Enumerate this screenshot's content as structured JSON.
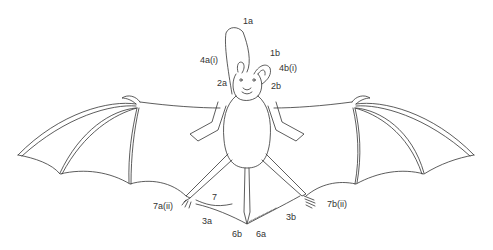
{
  "diagram": {
    "stroke_color": "#333333",
    "background": "#ffffff",
    "labels": [
      {
        "id": "1a",
        "text": "1a",
        "x": 243,
        "y": 17
      },
      {
        "id": "4a_i",
        "text": "4a(i)",
        "x": 200,
        "y": 56
      },
      {
        "id": "1b",
        "text": "1b",
        "x": 270,
        "y": 49
      },
      {
        "id": "4b_i",
        "text": "4b(i)",
        "x": 279,
        "y": 64
      },
      {
        "id": "2a",
        "text": "2a",
        "x": 217,
        "y": 79
      },
      {
        "id": "2b",
        "text": "2b",
        "x": 271,
        "y": 82
      },
      {
        "id": "7",
        "text": "7",
        "x": 212,
        "y": 193
      },
      {
        "id": "7a_ii",
        "text": "7a(ii)",
        "x": 153,
        "y": 202
      },
      {
        "id": "3a",
        "text": "3a",
        "x": 202,
        "y": 217
      },
      {
        "id": "3b",
        "text": "3b",
        "x": 286,
        "y": 213
      },
      {
        "id": "7b_ii",
        "text": "7b(ii)",
        "x": 327,
        "y": 200
      },
      {
        "id": "6b",
        "text": "6b",
        "x": 232,
        "y": 230
      },
      {
        "id": "6a",
        "text": "6a",
        "x": 256,
        "y": 230
      }
    ]
  }
}
